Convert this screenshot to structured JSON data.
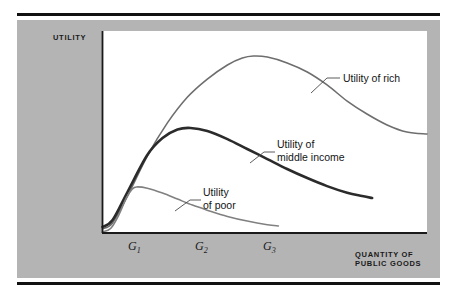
{
  "figure": {
    "background_color": "#ffffff",
    "panel_color": "#b4b4b4",
    "plot_color": "#ffffff",
    "rule_color": "#111111"
  },
  "axes": {
    "y_title": "UTILITY",
    "x_title": "QUANTITY OF\nPUBLIC GOODS",
    "axis_color": "#1a1a1a"
  },
  "labels": {
    "rich": "Utility of rich",
    "middle": "Utility of\nmiddle income",
    "poor": "Utility\nof poor"
  },
  "ticks": {
    "g1": "G",
    "g1_sub": "1",
    "g2": "G",
    "g2_sub": "2",
    "g3": "G",
    "g3_sub": "3"
  },
  "chart_data": {
    "type": "line",
    "title": "",
    "subtitle": "",
    "xlabel": "QUANTITY OF PUBLIC GOODS",
    "ylabel": "UTILITY",
    "grid": false,
    "legend_position": "inline-annotations",
    "xlim": [
      0,
      1
    ],
    "ylim": [
      0,
      1
    ],
    "xticks": [
      0.08,
      0.29,
      0.5
    ],
    "xticklabels": [
      "G1",
      "G2",
      "G3"
    ],
    "yticks": [],
    "yticklabels": [],
    "annotations": [
      {
        "text": "Utility of rich",
        "points_to_series": "Utility of rich"
      },
      {
        "text": "Utility of middle income",
        "points_to_series": "Utility of middle income"
      },
      {
        "text": "Utility of poor",
        "points_to_series": "Utility of poor"
      }
    ],
    "series": [
      {
        "name": "Utility of rich",
        "color": "#6e6e6e",
        "linewidth": 1.6,
        "peak_x": 0.465,
        "peak_y": 0.876,
        "x": [
          0.0,
          0.031,
          0.077,
          0.138,
          0.2,
          0.262,
          0.323,
          0.385,
          0.431,
          0.465,
          0.508,
          0.569,
          0.631,
          0.692,
          0.754,
          0.815,
          0.877,
          0.938,
          1.0
        ],
        "y": [
          0.02,
          0.05,
          0.183,
          0.381,
          0.545,
          0.673,
          0.762,
          0.832,
          0.866,
          0.876,
          0.871,
          0.842,
          0.797,
          0.733,
          0.653,
          0.589,
          0.535,
          0.5,
          0.49
        ]
      },
      {
        "name": "Utility of middle income",
        "color": "#2b2b2b",
        "linewidth": 2.6,
        "peak_x": 0.271,
        "peak_y": 0.52,
        "x_end": 0.831,
        "x": [
          0.0,
          0.031,
          0.077,
          0.138,
          0.185,
          0.231,
          0.271,
          0.323,
          0.385,
          0.446,
          0.508,
          0.569,
          0.631,
          0.692,
          0.754,
          0.8,
          0.831
        ],
        "y": [
          0.03,
          0.064,
          0.203,
          0.386,
          0.47,
          0.512,
          0.52,
          0.505,
          0.465,
          0.416,
          0.366,
          0.317,
          0.272,
          0.232,
          0.199,
          0.183,
          0.173
        ]
      },
      {
        "name": "Utility of poor",
        "color": "#808080",
        "linewidth": 1.6,
        "peak_x": 0.105,
        "peak_y": 0.228,
        "x_end": 0.542,
        "x": [
          0.0,
          0.025,
          0.049,
          0.074,
          0.092,
          0.105,
          0.138,
          0.185,
          0.231,
          0.277,
          0.323,
          0.385,
          0.446,
          0.508,
          0.542
        ],
        "y": [
          0.005,
          0.022,
          0.085,
          0.175,
          0.218,
          0.228,
          0.222,
          0.198,
          0.168,
          0.138,
          0.113,
          0.082,
          0.059,
          0.041,
          0.035
        ]
      }
    ]
  }
}
